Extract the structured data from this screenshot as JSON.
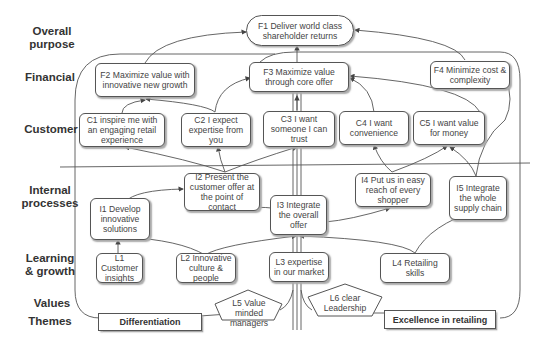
{
  "rows": [
    {
      "id": "overall_purpose",
      "label": "Overall\npurpose"
    },
    {
      "id": "financial",
      "label": "Financial"
    },
    {
      "id": "customer",
      "label": "Customer"
    },
    {
      "id": "internal_processes",
      "label": "Internal\nprocesses"
    },
    {
      "id": "learning_growth",
      "label": "Learning\n& growth"
    },
    {
      "id": "values",
      "label": "Values"
    },
    {
      "id": "themes",
      "label": "Themes"
    }
  ],
  "labels": {
    "overall_purpose": "Overall purpose",
    "financial": "Financial",
    "customer": "Customer",
    "internal_processes": "Internal processes",
    "learning_growth": "Learning & growth",
    "values": "Values",
    "themes": "Themes"
  },
  "nodes": {
    "F1": "F1 Deliver world class shareholder returns",
    "F2": "F2 Maximize value with innovative new growth",
    "F3": "F3 Maximize value through core offer",
    "F4": "F4 Minimize cost & complexity",
    "C1": "C1 inspire me with an engaging retail experience",
    "C2": "C2 I expect expertise from you",
    "C3": "C3 I want someone I can trust",
    "C4": "C4 I want convenience",
    "C5": "C5 I want value for money",
    "I1": "I1 Develop innovative solutions",
    "I2": "I2 Present the customer offer at the point of contact",
    "I3": "I3  Integrate the overall offer",
    "I4": "I4 Put us in easy reach  of every shopper",
    "I5": "I5 Integrate the whole supply chain",
    "L1": "L1 Customer insights",
    "L2": "L2 Innovative culture & people",
    "L3": "L3 expertise in our market",
    "L4": "L4 Retailing skills",
    "L5": "L5 Value minded managers",
    "L6": "L6 clear Leadership"
  },
  "themes": {
    "differentiation": "Differentiation",
    "excellence": "Excellence in retailing"
  },
  "edges": [
    [
      "F2",
      "F1"
    ],
    [
      "F3",
      "F1"
    ],
    [
      "F4",
      "F1"
    ],
    [
      "C1",
      "F2"
    ],
    [
      "C2",
      "F2"
    ],
    [
      "C2",
      "F3"
    ],
    [
      "C3",
      "F3"
    ],
    [
      "C4",
      "F3"
    ],
    [
      "C5",
      "F3"
    ],
    [
      "I2",
      "C1"
    ],
    [
      "I2",
      "C2"
    ],
    [
      "I2",
      "C3"
    ],
    [
      "I4",
      "C4"
    ],
    [
      "I4",
      "C5"
    ],
    [
      "I5",
      "C5"
    ],
    [
      "I5",
      "F4"
    ],
    [
      "I1",
      "I2"
    ],
    [
      "I3",
      "I2"
    ],
    [
      "I3",
      "I4"
    ],
    [
      "L1",
      "I1"
    ],
    [
      "L2",
      "I1"
    ],
    [
      "L2",
      "I3"
    ],
    [
      "L3",
      "I3"
    ],
    [
      "L4",
      "I3"
    ],
    [
      "L4",
      "I5"
    ]
  ],
  "colors": {
    "stroke": "#555555",
    "text": "#444444",
    "label": "#333333",
    "background": "#ffffff"
  }
}
